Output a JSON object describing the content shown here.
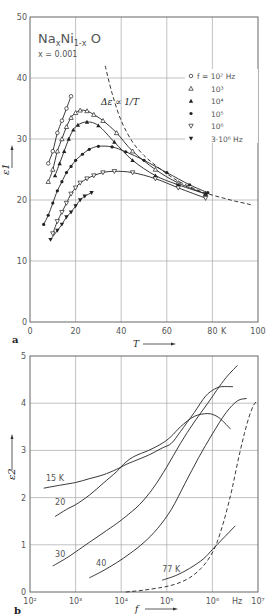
{
  "figure": {
    "panel_a_label": "a",
    "panel_b_label": "b"
  },
  "chart_data": [
    {
      "panel": "a",
      "type": "line",
      "title": "NaxNi1-xO",
      "title_main": "Na",
      "title_sub_x": "x",
      "title_mid": "Ni",
      "title_sub_1x": "1-x",
      "title_end": " O",
      "subtitle": "x = 0.001",
      "xlabel": "T",
      "xunit": "K",
      "ylabel": "ε1",
      "xlim": [
        0,
        100
      ],
      "ylim": [
        0,
        50
      ],
      "xticks": [
        0,
        20,
        40,
        60,
        80,
        100
      ],
      "yticks": [
        0,
        10,
        20,
        30,
        40,
        50
      ],
      "xtick_labels": [
        "0",
        "20",
        "40",
        "60",
        "80",
        "100"
      ],
      "ytick_labels": [
        "0",
        "10",
        "20",
        "30",
        "40",
        "50"
      ],
      "grid": true,
      "legend_position": "upper right",
      "annotation": "Δε ∝ 1/T",
      "series": [
        {
          "name": "f = 10² Hz",
          "marker": "open-circle",
          "x": [
            8,
            10,
            12,
            14,
            16,
            18
          ],
          "y": [
            26,
            28,
            31,
            33,
            35,
            37
          ]
        },
        {
          "name": "10³",
          "marker": "open-triangle",
          "x": [
            8,
            10,
            12,
            14,
            16,
            18,
            20,
            22,
            25,
            28,
            32,
            38,
            45,
            55,
            65,
            77
          ],
          "y": [
            23,
            25,
            28,
            30,
            32,
            33.5,
            34.3,
            34.7,
            34.6,
            34.0,
            33.0,
            31.0,
            28.0,
            25.0,
            22.8,
            21.0
          ]
        },
        {
          "name": "10⁴",
          "marker": "filled-triangle",
          "x": [
            11,
            13,
            15,
            17,
            19,
            21,
            25,
            30,
            37,
            45,
            55,
            65,
            77
          ],
          "y": [
            24,
            26,
            28,
            30,
            31.5,
            32.3,
            32.8,
            32.2,
            29.5,
            26.5,
            24.0,
            22.5,
            21.0
          ]
        },
        {
          "name": "10⁵",
          "marker": "filled-circle",
          "x": [
            6,
            8,
            10,
            12,
            14,
            16,
            18,
            20,
            23,
            26,
            30,
            36,
            42,
            50,
            60,
            70,
            78
          ],
          "y": [
            16,
            17.5,
            19.5,
            21.5,
            23,
            24.5,
            25.5,
            26.5,
            27.5,
            28.3,
            28.8,
            28.7,
            27.9,
            26.5,
            24.5,
            22.5,
            21.2
          ]
        },
        {
          "name": "10⁶",
          "marker": "open-inverted-triangle",
          "x": [
            10,
            12,
            14,
            16,
            18,
            20,
            22,
            25,
            28,
            32,
            37,
            45,
            55,
            65,
            77
          ],
          "y": [
            14.5,
            16.5,
            18.0,
            19.5,
            21.0,
            22.0,
            22.8,
            23.5,
            24.0,
            24.5,
            24.7,
            24.5,
            23.5,
            22.0,
            20.3
          ]
        },
        {
          "name": "3·10⁶ Hz",
          "marker": "filled-inverted-triangle",
          "x": [
            9,
            12,
            14,
            16,
            18,
            20,
            22,
            24,
            27
          ],
          "y": [
            13.5,
            15.0,
            16.0,
            17.2,
            18.0,
            19.0,
            20.0,
            20.6,
            21.2
          ]
        },
        {
          "name": "Δε ∝ 1/T",
          "style": "dashed",
          "x": [
            33,
            36,
            40,
            45,
            50,
            55,
            60,
            65,
            70,
            75,
            80,
            85,
            90,
            95,
            98
          ],
          "y": [
            42,
            37.5,
            33.0,
            29.5,
            27.3,
            25.7,
            24.3,
            23.1,
            22.2,
            21.4,
            20.8,
            20.3,
            19.8,
            19.4,
            19.1
          ]
        }
      ]
    },
    {
      "panel": "b",
      "type": "line",
      "xlabel": "f",
      "xunit": "Hz",
      "ylabel": "ε2",
      "xscale": "log",
      "xlim": [
        100,
        10000000
      ],
      "ylim": [
        0,
        5
      ],
      "xticks": [
        100,
        1000,
        10000,
        100000,
        1000000,
        10000000
      ],
      "xtick_labels": [
        "10²",
        "10³",
        "10⁴",
        "10⁵",
        "10⁶",
        "10⁷"
      ],
      "yticks": [
        0,
        1,
        2,
        3,
        4,
        5
      ],
      "ytick_labels": [
        "0",
        "1",
        "2",
        "3",
        "4",
        "5"
      ],
      "grid": true,
      "series": [
        {
          "name": "15 K",
          "logf": [
            2.3,
            2.7,
            3.0,
            3.3,
            3.6,
            3.9,
            4.1,
            4.3,
            4.6,
            4.9,
            5.1,
            5.3,
            5.6,
            5.85,
            6.05,
            6.2,
            6.45
          ],
          "y": [
            2.2,
            2.27,
            2.32,
            2.4,
            2.48,
            2.6,
            2.7,
            2.78,
            2.9,
            3.05,
            3.15,
            3.4,
            3.8,
            4.15,
            4.3,
            4.35,
            4.35
          ]
        },
        {
          "name": "20",
          "logf": [
            2.55,
            2.8,
            3.0,
            3.3,
            3.6,
            3.9,
            4.1,
            4.3,
            4.6,
            4.9,
            5.1,
            5.3,
            5.6,
            5.9,
            6.1,
            6.25,
            6.35,
            6.4
          ],
          "y": [
            1.6,
            1.75,
            1.85,
            2.05,
            2.3,
            2.55,
            2.75,
            2.88,
            3.0,
            3.15,
            3.3,
            3.5,
            3.72,
            3.78,
            3.72,
            3.6,
            3.5,
            3.45
          ]
        },
        {
          "name": "30",
          "logf": [
            2.5,
            2.8,
            3.0,
            3.3,
            3.6,
            3.9,
            4.1,
            4.4,
            4.7,
            5.0,
            5.3,
            5.6,
            5.9,
            6.15,
            6.35,
            6.55
          ],
          "y": [
            0.55,
            0.72,
            0.85,
            1.05,
            1.25,
            1.45,
            1.6,
            1.85,
            2.2,
            2.65,
            3.15,
            3.6,
            4.0,
            4.35,
            4.6,
            4.8
          ]
        },
        {
          "name": "40",
          "logf": [
            3.3,
            3.6,
            3.9,
            4.2,
            4.5,
            4.8,
            5.1,
            5.4,
            5.7,
            6.0,
            6.3,
            6.55,
            6.75
          ],
          "y": [
            0.3,
            0.45,
            0.62,
            0.82,
            1.05,
            1.35,
            1.75,
            2.3,
            2.85,
            3.35,
            3.8,
            4.05,
            4.1
          ]
        },
        {
          "name": "77 K",
          "logf": [
            4.9,
            5.2,
            5.5,
            5.8,
            6.0,
            6.2,
            6.35,
            6.5
          ],
          "y": [
            0.25,
            0.35,
            0.5,
            0.7,
            0.9,
            1.1,
            1.25,
            1.4
          ]
        },
        {
          "name": "dashed",
          "style": "dashed",
          "logf": [
            4.1,
            4.5,
            4.9,
            5.2,
            5.5,
            5.75,
            5.95,
            6.1,
            6.25,
            6.4,
            6.5,
            6.6,
            6.7,
            6.8,
            6.9,
            6.98
          ],
          "y": [
            0.0,
            0.04,
            0.1,
            0.17,
            0.3,
            0.5,
            0.75,
            1.05,
            1.5,
            2.05,
            2.5,
            2.95,
            3.35,
            3.7,
            3.95,
            4.05
          ]
        }
      ],
      "curve_labels": [
        {
          "text": "15 K",
          "logf": 2.35,
          "y": 2.35
        },
        {
          "text": "20",
          "logf": 2.55,
          "y": 1.85
        },
        {
          "text": "30",
          "logf": 2.55,
          "y": 0.75
        },
        {
          "text": "40",
          "logf": 3.45,
          "y": 0.55
        },
        {
          "text": "77 K",
          "logf": 4.9,
          "y": 0.42
        }
      ]
    }
  ]
}
